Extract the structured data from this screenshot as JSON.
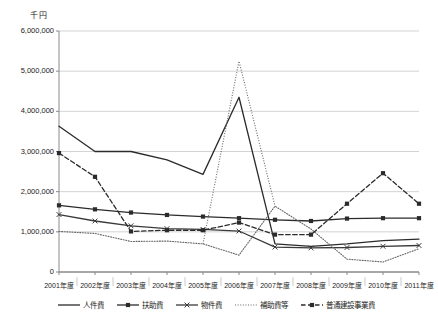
{
  "chart_data": {
    "type": "line",
    "title": "",
    "unit_label": "千円",
    "xlabel": "",
    "ylabel": "",
    "ylim": [
      0,
      6000000
    ],
    "ytick_labels": [
      "6,000,000",
      "5,000,000",
      "4,000,000",
      "3,000,000",
      "2,000,000",
      "1,000,000",
      "0"
    ],
    "ytick_values": [
      6000000,
      5000000,
      4000000,
      3000000,
      2000000,
      1000000,
      0
    ],
    "grid": true,
    "legend_position": "bottom",
    "categories": [
      "2001年度",
      "2002年度",
      "2003年度",
      "2004年度",
      "2005年度",
      "2006年度",
      "2007年度",
      "2008年度",
      "2009年度",
      "2010年度",
      "2011年度"
    ],
    "series": [
      {
        "name": "人件費",
        "style": "solid",
        "marker": "none",
        "color": "#2b2b2b",
        "values": [
          3630000,
          3000000,
          3000000,
          2790000,
          2430000,
          4350000,
          700000,
          640000,
          700000,
          780000,
          820000
        ]
      },
      {
        "name": "扶助費",
        "style": "solid",
        "marker": "square",
        "color": "#2b2b2b",
        "values": [
          1660000,
          1560000,
          1480000,
          1420000,
          1380000,
          1340000,
          1300000,
          1270000,
          1330000,
          1340000,
          1340000
        ]
      },
      {
        "name": "物件費",
        "style": "solid",
        "marker": "cross",
        "color": "#3a3a3a",
        "values": [
          1430000,
          1270000,
          1150000,
          1080000,
          1060000,
          1020000,
          620000,
          600000,
          610000,
          640000,
          660000
        ]
      },
      {
        "name": "補助費等",
        "style": "dotted",
        "marker": "none",
        "color": "#666666",
        "values": [
          1010000,
          960000,
          760000,
          770000,
          700000,
          420000,
          1640000,
          1070000,
          320000,
          250000,
          580000
        ]
      },
      {
        "name": "普通建設事業費",
        "style": "dashed",
        "marker": "square",
        "color": "#2b2b2b",
        "values": [
          2960000,
          2370000,
          1010000,
          1040000,
          1040000,
          1230000,
          930000,
          930000,
          1700000,
          2460000,
          1700000
        ]
      }
    ],
    "annotations": {
      "peak_2006_jinkenhi": 4350000,
      "peak_2006_hojohitou": 5250000
    }
  },
  "legend": {
    "items": [
      {
        "label": "人件費"
      },
      {
        "label": "扶助費"
      },
      {
        "label": "物件費"
      },
      {
        "label": "補助費等"
      },
      {
        "label": "普通建設事業費"
      }
    ]
  }
}
